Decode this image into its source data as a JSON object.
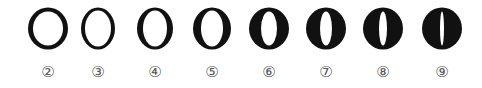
{
  "diagram": {
    "title": "",
    "color": "#111111",
    "items": [
      {
        "label": "②",
        "cx": 48,
        "outer_rx": 20,
        "outer_ry": 21,
        "inner_rx": 15,
        "inner_ry": 17
      },
      {
        "label": "③",
        "cx": 98,
        "outer_rx": 17,
        "outer_ry": 21,
        "inner_rx": 13,
        "inner_ry": 18
      },
      {
        "label": "④",
        "cx": 155,
        "outer_rx": 18,
        "outer_ry": 21,
        "inner_rx": 12,
        "inner_ry": 18
      },
      {
        "label": "⑤",
        "cx": 212,
        "outer_rx": 19,
        "outer_ry": 21,
        "inner_rx": 11,
        "inner_ry": 18
      },
      {
        "label": "⑥",
        "cx": 269,
        "outer_rx": 20,
        "outer_ry": 21,
        "inner_rx": 8,
        "inner_ry": 17
      },
      {
        "label": "⑦",
        "cx": 326,
        "outer_rx": 20,
        "outer_ry": 21,
        "inner_rx": 6,
        "inner_ry": 17
      },
      {
        "label": "⑧",
        "cx": 383,
        "outer_rx": 20,
        "outer_ry": 21,
        "inner_rx": 4,
        "inner_ry": 17
      },
      {
        "label": "⑨",
        "cx": 442,
        "outer_rx": 20,
        "outer_ry": 21,
        "inner_rx": 2,
        "inner_ry": 17
      }
    ]
  }
}
